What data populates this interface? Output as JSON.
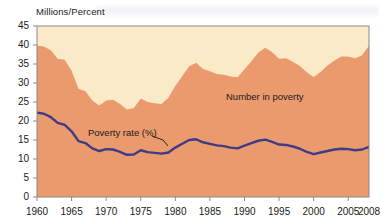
{
  "figure": {
    "y_axis_title": "Millions/Percent",
    "annotations": {
      "area_label": "Number in poverty",
      "line_label": "Poverty rate (%)"
    }
  },
  "colors": {
    "area_fill": "#eb9a6e",
    "plot_background": "#faeac8",
    "line_color": "#3f3b85",
    "frame_color": "#8d8a86",
    "text_color": "#1a1a1a"
  },
  "chart_data": {
    "type": "area",
    "title": "",
    "subtitle": "",
    "xlabel": "",
    "ylabel": "Millions/Percent",
    "xlim": [
      1960,
      2008
    ],
    "ylim": [
      0,
      45
    ],
    "grid": false,
    "legend_position": "inline-annotations",
    "xticks": [
      1960,
      1965,
      1970,
      1975,
      1980,
      1985,
      1990,
      1995,
      2000,
      2005,
      2008
    ],
    "yticks": [
      0,
      5,
      10,
      15,
      20,
      25,
      30,
      35,
      40,
      45
    ],
    "x": [
      1960,
      1961,
      1962,
      1963,
      1964,
      1965,
      1966,
      1967,
      1968,
      1969,
      1970,
      1971,
      1972,
      1973,
      1974,
      1975,
      1976,
      1977,
      1978,
      1979,
      1980,
      1981,
      1982,
      1983,
      1984,
      1985,
      1986,
      1987,
      1988,
      1989,
      1990,
      1991,
      1992,
      1993,
      1994,
      1995,
      1996,
      1997,
      1998,
      1999,
      2000,
      2001,
      2002,
      2003,
      2004,
      2005,
      2006,
      2007,
      2008
    ],
    "series": [
      {
        "name": "Number in poverty",
        "unit": "millions",
        "render": "area",
        "values": [
          39.9,
          39.6,
          38.6,
          36.4,
          36.1,
          33.2,
          28.5,
          27.8,
          25.4,
          24.1,
          25.4,
          25.6,
          24.5,
          23.0,
          23.4,
          25.9,
          25.0,
          24.7,
          24.5,
          26.1,
          29.3,
          31.8,
          34.4,
          35.3,
          33.7,
          33.1,
          32.4,
          32.2,
          31.7,
          31.5,
          33.6,
          35.7,
          38.0,
          39.3,
          38.1,
          36.4,
          36.5,
          35.6,
          34.5,
          32.8,
          31.6,
          32.9,
          34.6,
          35.9,
          37.0,
          37.0,
          36.5,
          37.3,
          39.8
        ]
      },
      {
        "name": "Poverty rate (%)",
        "unit": "percent",
        "render": "line",
        "values": [
          22.2,
          21.9,
          21.0,
          19.5,
          19.0,
          17.3,
          14.7,
          14.2,
          12.8,
          12.1,
          12.6,
          12.5,
          11.9,
          11.1,
          11.2,
          12.3,
          11.8,
          11.6,
          11.4,
          11.7,
          13.0,
          14.0,
          15.0,
          15.2,
          14.4,
          14.0,
          13.6,
          13.4,
          13.0,
          12.8,
          13.5,
          14.2,
          14.8,
          15.1,
          14.5,
          13.8,
          13.7,
          13.3,
          12.7,
          11.9,
          11.3,
          11.7,
          12.1,
          12.5,
          12.7,
          12.6,
          12.3,
          12.5,
          13.2
        ]
      }
    ]
  }
}
